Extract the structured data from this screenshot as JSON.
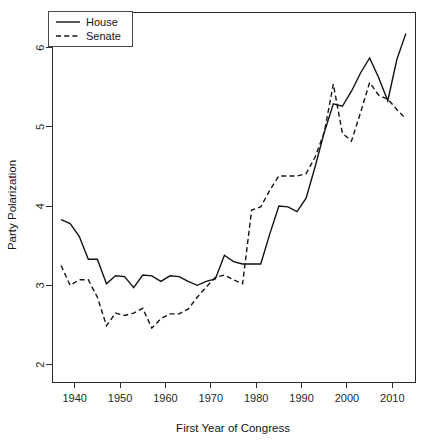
{
  "chart_data": {
    "type": "line",
    "title": "",
    "xlabel": "First Year of Congress",
    "ylabel": "Party Polarization",
    "xlim": [
      1935,
      2015
    ],
    "ylim": [
      1.78,
      6.45
    ],
    "grid": false,
    "legend_position": "top-left",
    "xticks": [
      1940,
      1950,
      1960,
      1970,
      1980,
      1990,
      2000,
      2010
    ],
    "yticks": [
      2,
      3,
      4,
      5,
      6
    ],
    "x": [
      1937,
      1939,
      1941,
      1943,
      1945,
      1947,
      1949,
      1951,
      1953,
      1955,
      1957,
      1959,
      1961,
      1963,
      1965,
      1967,
      1969,
      1971,
      1973,
      1975,
      1977,
      1979,
      1981,
      1983,
      1985,
      1987,
      1989,
      1991,
      1993,
      1995,
      1997,
      1999,
      2001,
      2003,
      2005,
      2007,
      2009,
      2011,
      2013
    ],
    "series": [
      {
        "name": "House",
        "style": "solid",
        "values": [
          3.83,
          3.78,
          3.62,
          3.33,
          3.33,
          3.02,
          3.12,
          3.11,
          2.97,
          3.13,
          3.12,
          3.05,
          3.12,
          3.11,
          3.05,
          3.0,
          3.05,
          3.08,
          3.38,
          3.3,
          3.27,
          3.27,
          3.27,
          3.65,
          4.0,
          3.99,
          3.93,
          4.1,
          4.5,
          4.93,
          5.29,
          5.26,
          5.45,
          5.68,
          5.87,
          5.62,
          5.33,
          5.85,
          6.18
        ]
      },
      {
        "name": "Senate",
        "style": "dashed",
        "values": [
          3.25,
          3.0,
          3.07,
          3.07,
          2.85,
          2.49,
          2.65,
          2.62,
          2.65,
          2.71,
          2.46,
          2.58,
          2.64,
          2.64,
          2.7,
          2.85,
          2.98,
          3.1,
          3.13,
          3.07,
          3.02,
          3.95,
          3.99,
          4.2,
          4.38,
          4.38,
          4.38,
          4.41,
          4.62,
          4.93,
          5.54,
          4.92,
          4.82,
          5.18,
          5.56,
          5.4,
          5.35,
          5.22,
          5.1
        ]
      }
    ]
  },
  "legend": {
    "entries": [
      {
        "label": "House"
      },
      {
        "label": "Senate"
      }
    ]
  },
  "axes": {
    "x_title": "First Year of Congress",
    "y_title": "Party Polarization",
    "x_tick_labels": [
      "1940",
      "1950",
      "1960",
      "1970",
      "1980",
      "1990",
      "2000",
      "2010"
    ],
    "y_tick_labels": [
      "2",
      "3",
      "4",
      "5",
      "6"
    ]
  }
}
